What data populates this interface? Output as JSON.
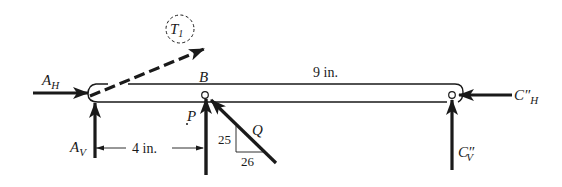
{
  "diagram": {
    "type": "free-body-diagram",
    "labels": {
      "t1": "T",
      "t1_sub": "1",
      "ah": "A",
      "ah_sub": "H",
      "av": "A",
      "av_sub": "V",
      "b": "B",
      "p": "P",
      "q": "Q",
      "ch": "C″",
      "ch_sub": "H",
      "cv": "C″",
      "cv_sub": "V"
    },
    "dimensions": {
      "span_ab": "4 in.",
      "span_bc": "9 in."
    },
    "slope": {
      "rise": "25",
      "run": "26"
    },
    "colors": {
      "ink": "#1a1a1a",
      "background": "#ffffff"
    }
  }
}
